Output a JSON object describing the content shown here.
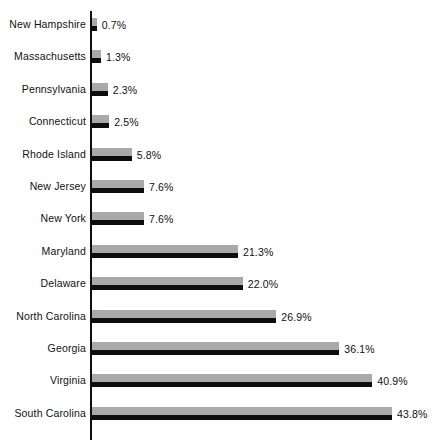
{
  "chart_data": {
    "type": "bar",
    "orientation": "horizontal",
    "title": "",
    "subtitle": "",
    "xlabel": "",
    "ylabel": "",
    "grid": false,
    "legend": null,
    "axis_line": "value-axis at zero, vertical",
    "xlim": [
      0,
      43.8
    ],
    "value_suffix": "%",
    "categories": [
      "New Hampshire",
      "Massachusetts",
      "Pennsylvania",
      "Connecticut",
      "Rhode Island",
      "New Jersey",
      "New York",
      "Maryland",
      "Delaware",
      "North Carolina",
      "Georgia",
      "Virginia",
      "South Carolina"
    ],
    "values": [
      0.7,
      1.3,
      2.3,
      2.5,
      5.8,
      7.6,
      7.6,
      21.3,
      22.0,
      26.9,
      36.1,
      40.9,
      43.8
    ],
    "data_labels": [
      "0.7%",
      "1.3%",
      "2.3%",
      "2.5%",
      "5.8%",
      "7.6%",
      "7.6%",
      "21.3%",
      "22.0%",
      "26.9%",
      "36.1%",
      "40.9%",
      "43.8%"
    ],
    "bars": [
      {
        "category": "New Hampshire",
        "value": 0.7,
        "label": "0.7%"
      },
      {
        "category": "Massachusetts",
        "value": 1.3,
        "label": "1.3%"
      },
      {
        "category": "Pennsylvania",
        "value": 2.3,
        "label": "2.3%"
      },
      {
        "category": "Connecticut",
        "value": 2.5,
        "label": "2.5%"
      },
      {
        "category": "Rhode Island",
        "value": 5.8,
        "label": "5.8%"
      },
      {
        "category": "New Jersey",
        "value": 7.6,
        "label": "7.6%"
      },
      {
        "category": "New York",
        "value": 7.6,
        "label": "7.6%"
      },
      {
        "category": "Maryland",
        "value": 21.3,
        "label": "21.3%"
      },
      {
        "category": "Delaware",
        "value": 22.0,
        "label": "22.0%"
      },
      {
        "category": "North Carolina",
        "value": 26.9,
        "label": "26.9%"
      },
      {
        "category": "Georgia",
        "value": 36.1,
        "label": "36.1%"
      },
      {
        "category": "Virginia",
        "value": 40.9,
        "label": "40.9%"
      },
      {
        "category": "South Carolina",
        "value": 43.8,
        "label": "43.8%"
      }
    ],
    "colors": {
      "bar_fill": "#a9a9a9",
      "bar_shadow": "#0d0d0d",
      "axis": "#0d0d0d",
      "text": "#111111",
      "background": "#ffffff"
    }
  },
  "layout": {
    "axis_x_px": 91,
    "row_pitch_px": 32.4,
    "first_row_top_px": 18,
    "px_per_percent": 6.85,
    "bar_top_height_px": 8,
    "bar_shadow_height_px": 5,
    "value_label_gap_px": 5
  }
}
